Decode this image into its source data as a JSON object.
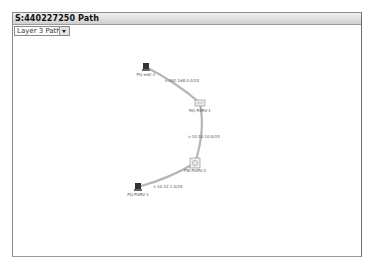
{
  "window": {
    "title": "S:440227250 Path"
  },
  "layer_select": {
    "selected": "Layer 3 Path"
  },
  "colors": {
    "link": "#b5b5b5",
    "titlebar": "#d8d8d8",
    "frame_border": "#8a8a8a",
    "node_dark": "#333333"
  },
  "topology": {
    "nodes": [
      {
        "id": "n1",
        "label": "PQ-edit-1",
        "type": "host",
        "x": 146,
        "y": 67
      },
      {
        "id": "n2",
        "label": "RQ-RSRV-1",
        "type": "router",
        "x": 200,
        "y": 103
      },
      {
        "id": "n3",
        "label": "FW-RSRV-2",
        "type": "firewall",
        "x": 195,
        "y": 163
      },
      {
        "id": "n4",
        "label": "PQ-RSRV-1",
        "type": "host",
        "x": 138,
        "y": 187
      }
    ],
    "links": [
      {
        "from": "n1",
        "to": "n2",
        "label": "s-192.168.0.0/24",
        "lx": 182,
        "ly": 82
      },
      {
        "from": "n2",
        "to": "n3",
        "label": "s-10.10.10.0/24",
        "lx": 204,
        "ly": 138
      },
      {
        "from": "n3",
        "to": "n4",
        "label": "s-10.32.1.0/24",
        "lx": 168,
        "ly": 188
      }
    ]
  }
}
